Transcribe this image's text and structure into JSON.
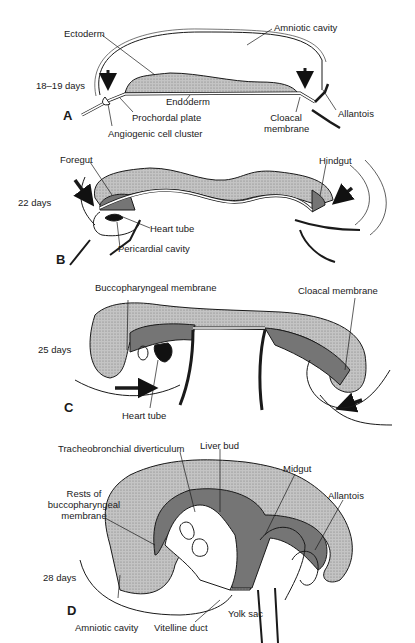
{
  "figure": {
    "colors": {
      "tissue": "#bdbdbd",
      "stipple": "#8a8a8a",
      "line": "#1a1a1a",
      "heart": "#111111",
      "background": "#ffffff"
    },
    "panels": [
      {
        "id": "A",
        "age": "18–19 days",
        "labels": {
          "ectoderm": "Ectoderm",
          "amniotic_cavity": "Amniotic cavity",
          "endoderm": "Endoderm",
          "prochordal_plate": "Prochordal plate",
          "angiogenic_cell_cluster": "Angiogenic cell cluster",
          "cloacal_membrane_l1": "Cloacal",
          "cloacal_membrane_l2": "membrane",
          "allantois": "Allantois"
        }
      },
      {
        "id": "B",
        "age": "22 days",
        "labels": {
          "foregut": "Foregut",
          "hindgut": "Hindgut",
          "heart_tube": "Heart tube",
          "pericardial_cavity": "Pericardial cavity"
        }
      },
      {
        "id": "C",
        "age": "25 days",
        "labels": {
          "buccopharyngeal_membrane": "Buccopharyngeal membrane",
          "cloacal_membrane": "Cloacal membrane",
          "heart_tube": "Heart tube"
        }
      },
      {
        "id": "D",
        "age": "28 days",
        "labels": {
          "tracheobronchial_diverticulum": "Tracheobronchial diverticulum",
          "liver_bud": "Liver bud",
          "midgut": "Midgut",
          "rests_l1": "Rests of",
          "rests_l2": "buccopharyngeal",
          "rests_l3": "membrane",
          "allantois": "Allantois",
          "amniotic_cavity": "Amniotic cavity",
          "vitelline_duct": "Vitelline duct",
          "yolk_sac": "Yolk sac"
        }
      }
    ]
  }
}
